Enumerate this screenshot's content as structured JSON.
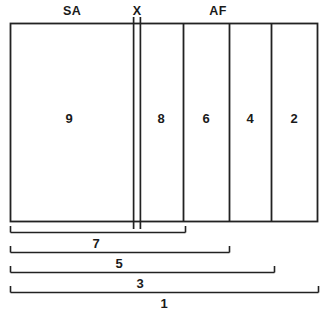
{
  "diagram": {
    "type": "schematic-band-diagram",
    "stroke_color": "#222222",
    "background_color": "#ffffff",
    "region_labels": [
      {
        "name": "SA",
        "text": "SA",
        "x": 72,
        "y": 11
      },
      {
        "name": "X",
        "text": "X",
        "x": 137,
        "y": 11
      },
      {
        "name": "AF",
        "text": "AF",
        "x": 218,
        "y": 11
      }
    ],
    "cells": [
      {
        "name": "cell-9",
        "text": "9",
        "x0": 10,
        "x1": 133,
        "cx": 69,
        "cy": 118
      },
      {
        "name": "cell-8",
        "text": "8",
        "x0": 141,
        "x1": 183,
        "cx": 161,
        "cy": 118
      },
      {
        "name": "cell-6",
        "text": "6",
        "x0": 183,
        "x1": 229,
        "cx": 206,
        "cy": 118
      },
      {
        "name": "cell-4",
        "text": "4",
        "x0": 229,
        "x1": 271,
        "cx": 250,
        "cy": 118
      },
      {
        "name": "cell-2",
        "text": "2",
        "x0": 271,
        "x1": 318,
        "cx": 294,
        "cy": 118
      }
    ],
    "frame": {
      "x0": 10,
      "y0": 23,
      "x1": 318,
      "y1": 222
    },
    "x_band": {
      "x0": 133,
      "x1": 141,
      "top": 17,
      "bottom": 229
    },
    "dimensions": [
      {
        "name": "dimension-7",
        "text": "7",
        "x0": 10,
        "x1": 185,
        "y": 232,
        "label_x": 96,
        "label_y": 243
      },
      {
        "name": "dimension-5",
        "text": "5",
        "x0": 10,
        "x1": 229,
        "y": 252,
        "label_x": 119,
        "label_y": 263
      },
      {
        "name": "dimension-3",
        "text": "3",
        "x0": 10,
        "x1": 274,
        "y": 272,
        "label_x": 140,
        "label_y": 283
      },
      {
        "name": "dimension-1",
        "text": "1",
        "x0": 10,
        "x1": 318,
        "y": 292,
        "label_x": 164,
        "label_y": 303
      }
    ]
  }
}
